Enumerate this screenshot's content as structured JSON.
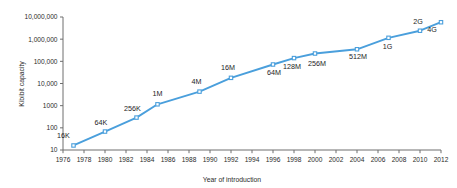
{
  "chart_data": {
    "type": "line",
    "title": "",
    "subtitle": "",
    "xlabel": "Year of introduction",
    "ylabel": "Kibibit capacity",
    "xlim": [
      1976,
      2012
    ],
    "ylim": [
      10,
      10000000
    ],
    "yscale": "log",
    "grid": false,
    "legend": null,
    "accent_color": "#4a9fdc",
    "marker": "square-open",
    "x_ticks": [
      1976,
      1978,
      1980,
      1982,
      1984,
      1986,
      1988,
      1990,
      1992,
      1994,
      1996,
      1998,
      2000,
      2002,
      2004,
      2006,
      2008,
      2010,
      2012
    ],
    "x_tick_labels": [
      "1976",
      "1978",
      "1980",
      "1982",
      "1984",
      "1986",
      "1988",
      "1990",
      "1992",
      "1994",
      "1996",
      "1998",
      "2000",
      "2002",
      "2004",
      "2006",
      "2008",
      "2010",
      "2012"
    ],
    "y_ticks": [
      10,
      100,
      1000,
      10000,
      100000,
      1000000,
      10000000
    ],
    "y_tick_labels": [
      "10",
      "100",
      "1000",
      "10,000",
      "100,000",
      "1,000,000",
      "10,000,000"
    ],
    "series": [
      {
        "name": "DRAM capacity",
        "points": [
          {
            "label": "16K",
            "x": 1977,
            "y": 16,
            "label_dx": -10,
            "label_dy": -7
          },
          {
            "label": "64K",
            "x": 1980,
            "y": 68,
            "label_dx": -4,
            "label_dy": -7
          },
          {
            "label": "256K",
            "x": 1983,
            "y": 290,
            "label_dx": -4,
            "label_dy": -7
          },
          {
            "label": "1M",
            "x": 1985,
            "y": 1150,
            "label_dx": 0,
            "label_dy": -8
          },
          {
            "label": "4M",
            "x": 1989,
            "y": 4300,
            "label_dx": -3,
            "label_dy": -8
          },
          {
            "label": "16M",
            "x": 1992,
            "y": 18000,
            "label_dx": -3,
            "label_dy": -8
          },
          {
            "label": "64M",
            "x": 1996,
            "y": 72000,
            "label_dx": 1,
            "label_dy": 10
          },
          {
            "label": "128M",
            "x": 1998,
            "y": 140000,
            "label_dx": -2,
            "label_dy": 11
          },
          {
            "label": "256M",
            "x": 2000,
            "y": 225000,
            "label_dx": 2,
            "label_dy": 12
          },
          {
            "label": "512M",
            "x": 2004,
            "y": 350000,
            "label_dx": 1,
            "label_dy": 10
          },
          {
            "label": "1G",
            "x": 2007,
            "y": 1150000,
            "label_dx": -1,
            "label_dy": 11
          },
          {
            "label": "2G",
            "x": 2010,
            "y": 2400000,
            "label_dx": -2,
            "label_dy": -7
          },
          {
            "label": "4G",
            "x": 2012,
            "y": 5800000,
            "label_dx": -9,
            "label_dy": 10
          }
        ]
      }
    ]
  },
  "axes": {
    "y_title": "Kibibit capacity",
    "x_title": "Year of introduction"
  }
}
